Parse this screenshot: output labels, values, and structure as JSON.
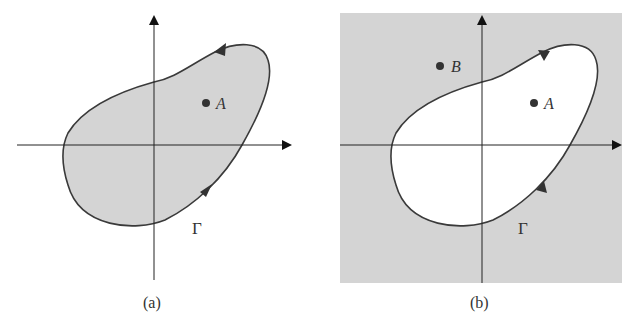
{
  "figure": {
    "panels": [
      {
        "id": "a",
        "caption": "(a)",
        "curve_label": "Γ",
        "points": [
          {
            "label": "A"
          }
        ],
        "orientation": "counterclockwise",
        "shading": "interior"
      },
      {
        "id": "b",
        "caption": "(b)",
        "curve_label": "Γ",
        "points": [
          {
            "label": "B"
          },
          {
            "label": "A"
          }
        ],
        "orientation": "clockwise",
        "shading": "exterior"
      }
    ],
    "colors": {
      "shade": "#d4d4d4",
      "stroke": "#3a3a3a",
      "background": "#ffffff"
    }
  }
}
